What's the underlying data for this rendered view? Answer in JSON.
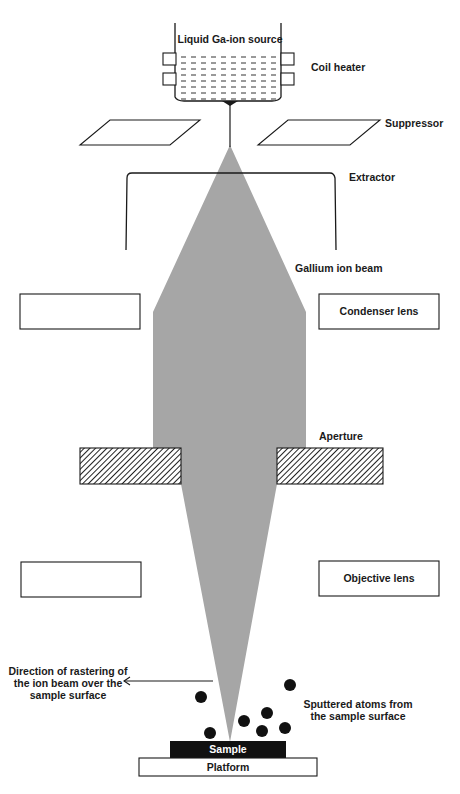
{
  "diagram": {
    "type": "Focused ion beam (FIB) schematic",
    "labels": {
      "source": "Liquid Ga-ion source",
      "coil_heater": "Coil heater",
      "suppressor": "Suppressor",
      "extractor": "Extractor",
      "beam": "Gallium ion beam",
      "condenser": "Condenser lens",
      "aperture": "Aperture",
      "objective": "Objective lens",
      "raster_line1": "Direction of rastering of",
      "raster_line2": "the ion beam over the",
      "raster_line3": "sample surface",
      "sputter_line1": "Sputtered atoms from",
      "sputter_line2": "the sample surface",
      "sample": "Sample",
      "platform": "Platform"
    },
    "colors": {
      "beam": "#a6a6a6",
      "outline": "#1a1a1a",
      "sample": "#111111",
      "background": "#ffffff"
    }
  }
}
